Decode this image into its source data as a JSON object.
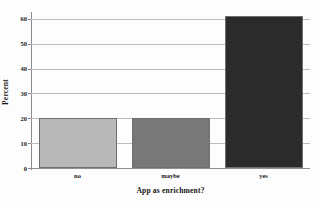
{
  "chart_data": {
    "type": "bar",
    "title": "",
    "subtitle": "",
    "xlabel": "App as enrichment?",
    "ylabel": "Percent",
    "categories": [
      "no",
      "maybe",
      "yes"
    ],
    "values": [
      20,
      20,
      61
    ],
    "series": [
      {
        "name": "Percent",
        "values": [
          20,
          20,
          61
        ]
      }
    ],
    "bar_colors": [
      "#b8b8b8",
      "#787878",
      "#2b2b2b"
    ],
    "bar_edge_color": "#6f6f6f",
    "ylim": [
      0,
      62
    ],
    "y_ticks": [
      0,
      10,
      20,
      30,
      40,
      50,
      60
    ],
    "y_tick_labels": [
      "0",
      "10",
      "20",
      "30",
      "40",
      "50",
      "60"
    ],
    "grid": "horizontal",
    "grid_color": "#bdbdbd",
    "legend": "none",
    "legend_position": "",
    "background_color": "#fdfdfd",
    "axis_color": "#8b8b8b",
    "annotations": []
  },
  "axes": {
    "x_title": "App as enrichment?",
    "y_title": "Percent"
  }
}
